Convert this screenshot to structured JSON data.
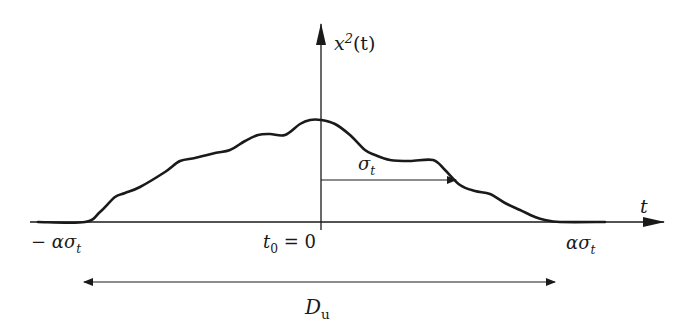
{
  "chart_data": {
    "type": "line",
    "title": "",
    "xlabel": "t",
    "ylabel": "x²(t)",
    "axis_annotations": {
      "y_axis_label": "x²(t)",
      "x_axis_label": "t",
      "left_limit": "− ασ_t",
      "center": "t₀ = 0",
      "right_limit": "ασ_t",
      "sigma_arrow": "σ_t",
      "duration_arrow": "D_u"
    },
    "grid": false,
    "legend": null,
    "curve_points_px": [
      [
        38,
        222
      ],
      [
        85,
        222
      ],
      [
        100,
        212
      ],
      [
        115,
        197
      ],
      [
        125,
        193
      ],
      [
        140,
        187
      ],
      [
        165,
        172
      ],
      [
        180,
        161
      ],
      [
        195,
        158
      ],
      [
        215,
        153
      ],
      [
        230,
        150
      ],
      [
        245,
        141
      ],
      [
        258,
        135
      ],
      [
        270,
        134
      ],
      [
        285,
        135
      ],
      [
        300,
        124
      ],
      [
        310,
        120
      ],
      [
        321,
        120
      ],
      [
        335,
        124
      ],
      [
        350,
        135
      ],
      [
        365,
        150
      ],
      [
        375,
        155
      ],
      [
        390,
        160
      ],
      [
        410,
        161
      ],
      [
        433,
        160
      ],
      [
        445,
        170
      ],
      [
        460,
        185
      ],
      [
        475,
        191
      ],
      [
        490,
        194
      ],
      [
        505,
        203
      ],
      [
        520,
        210
      ],
      [
        535,
        217
      ],
      [
        545,
        220
      ],
      [
        560,
        222
      ],
      [
        605,
        222
      ]
    ]
  },
  "labels": {
    "y_axis": {
      "base": "x",
      "sup": "2",
      "rest": "(t)"
    },
    "x_axis": "t",
    "left_limit": {
      "prefix": "− ασ",
      "sub": "t"
    },
    "center": {
      "base": "t",
      "sub": "0",
      "rest": " = 0"
    },
    "right_limit": {
      "prefix": "ασ",
      "sub": "t"
    },
    "sigma": {
      "base": "σ",
      "sub": "t"
    },
    "duration": {
      "base": "D",
      "sub": "u"
    }
  },
  "colors": {
    "ink": "#1a1a1a",
    "background": "#ffffff"
  }
}
